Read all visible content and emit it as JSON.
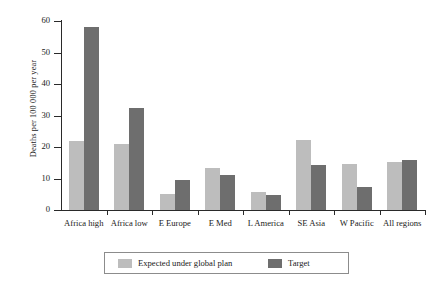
{
  "chart_data": {
    "type": "bar",
    "title": "",
    "subtitle": "",
    "xlabel": "",
    "ylabel": "Deaths per 100 000 per year",
    "ylim": [
      0,
      60
    ],
    "yticks": [
      0,
      10,
      20,
      30,
      40,
      50,
      60
    ],
    "ytick_labels": [
      "0",
      "10",
      "20",
      "30",
      "40",
      "50",
      "60"
    ],
    "grid": false,
    "legend_position": "bottom",
    "categories": [
      "Africa high",
      "Africa low",
      "E Europe",
      "E Med",
      "L America",
      "SE Asia",
      "W Pacific",
      "All regions"
    ],
    "series": [
      {
        "name": "Expected under global plan",
        "color": "#bdbdbd",
        "values": [
          22.0,
          21.0,
          5.0,
          13.3,
          5.7,
          22.2,
          14.6,
          15.4
        ]
      },
      {
        "name": "Target",
        "color": "#6e6e6e",
        "values": [
          58.0,
          32.4,
          9.6,
          11.2,
          4.8,
          14.3,
          7.3,
          16.0
        ]
      }
    ]
  },
  "legend": {
    "entries": [
      {
        "label": "Expected under global plan",
        "color": "#bdbdbd"
      },
      {
        "label": "Target",
        "color": "#6e6e6e"
      }
    ]
  },
  "colors": {
    "expected": "#bdbdbd",
    "target": "#6e6e6e",
    "axis": "#2a2a2a",
    "text": "#1a1a1a",
    "background": "#ffffff",
    "legend_border": "#8c8c8c"
  }
}
